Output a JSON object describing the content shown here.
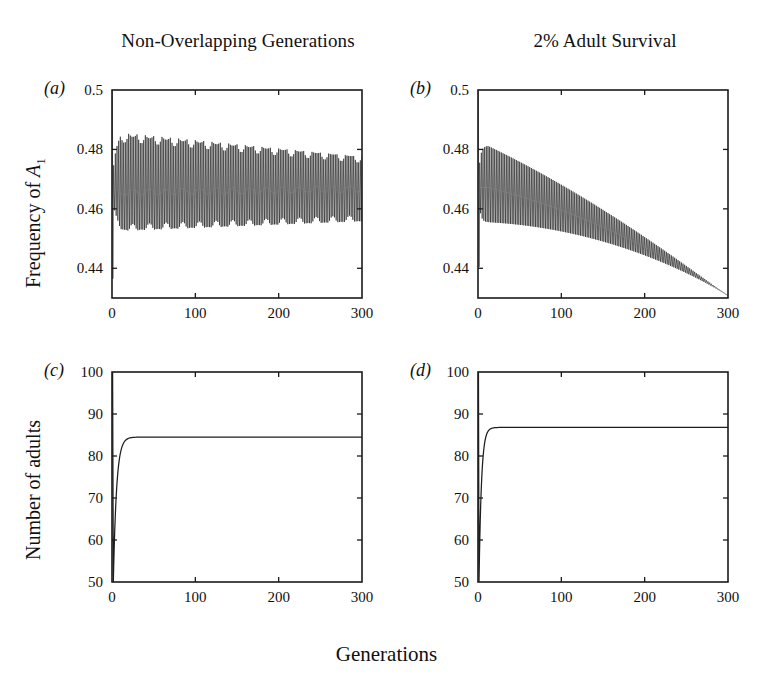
{
  "figure": {
    "column_titles": {
      "left": "Non-Overlapping Generations",
      "right": "2% Adult Survival"
    },
    "x_axis_title": "Generations",
    "y_axis_title_top_prefix": "Frequency of ",
    "y_axis_title_top_symbol": "A",
    "y_axis_title_top_subscript": "1",
    "y_axis_title_bottom": "Number of adults",
    "panel_labels": {
      "a": "(a)",
      "b": "(b)",
      "c": "(c)",
      "d": "(d)"
    },
    "ink_color": "#1d1d1d"
  },
  "chart_data": [
    {
      "id": "panel-a",
      "type": "line",
      "title": "Non-Overlapping Generations",
      "panel_label": "(a)",
      "xlabel": "Generations",
      "ylabel": "Frequency of A1",
      "xlim": [
        0,
        300
      ],
      "ylim": [
        0.43,
        0.5
      ],
      "xticks": [
        0,
        100,
        200,
        300
      ],
      "xtick_labels": [
        "0",
        "100",
        "200",
        "300"
      ],
      "yticks": [
        0.44,
        0.46,
        0.48,
        0.5
      ],
      "ytick_labels": [
        "0.44",
        "0.46",
        "0.48",
        "0.5"
      ],
      "grid": false,
      "legend": "none",
      "description": "Two-cycle allele frequency oscillation with slowly narrowing envelope and a beat modulation near the midline.",
      "series": [
        {
          "name": "Frequency of A1",
          "model": "two_cycle",
          "initial_value": 0.5,
          "transient_min": 0.4365,
          "envelope_upper": {
            "start_gen": 14,
            "start": 0.4855,
            "end_gen": 300,
            "end": 0.4775
          },
          "envelope_lower": {
            "start_gen": 14,
            "start": 0.4525,
            "end_gen": 300,
            "end": 0.4558
          },
          "midline": {
            "start": 0.4655,
            "end": 0.4667
          },
          "beat_period": 20,
          "beat_amplitude": 0.0022,
          "rise_rate": 0.28
        }
      ]
    },
    {
      "id": "panel-b",
      "type": "line",
      "title": "2% Adult Survival",
      "panel_label": "(b)",
      "xlabel": "Generations",
      "ylabel": "Frequency of A1",
      "xlim": [
        0,
        300
      ],
      "ylim": [
        0.43,
        0.5
      ],
      "xticks": [
        0,
        100,
        200,
        300
      ],
      "xtick_labels": [
        "0",
        "100",
        "200",
        "300"
      ],
      "yticks": [
        0.44,
        0.46,
        0.48,
        0.5
      ],
      "ytick_labels": [
        "0.44",
        "0.46",
        "0.48",
        "0.5"
      ],
      "grid": false,
      "legend": "none",
      "description": "Two-cycle oscillation whose amplitude decays to zero while the mean drifts down, converging at the lower axis by generation 300.",
      "series": [
        {
          "name": "Frequency of A1",
          "model": "damped_two_cycle",
          "initial_value": 0.5,
          "transient_min": 0.4405,
          "peak_gen": 12,
          "peak_upper": 0.4812,
          "peak_lower": 0.4555,
          "end_value": 0.4308,
          "midline_peak": 0.4672,
          "decay_exponent": 1.35
        }
      ]
    },
    {
      "id": "panel-c",
      "type": "line",
      "title": "Non-Overlapping Generations",
      "panel_label": "(c)",
      "xlabel": "Generations",
      "ylabel": "Number of adults",
      "xlim": [
        0,
        300
      ],
      "ylim": [
        50,
        100
      ],
      "xticks": [
        0,
        100,
        200,
        300
      ],
      "xtick_labels": [
        "0",
        "100",
        "200",
        "300"
      ],
      "yticks": [
        50,
        60,
        70,
        80,
        90,
        100
      ],
      "ytick_labels": [
        "50",
        "60",
        "70",
        "80",
        "90",
        "100"
      ],
      "grid": false,
      "legend": "none",
      "description": "Adult population crashes from 100 to 50 then rises and saturates at a plateau near 84.5.",
      "series": [
        {
          "name": "Number of adults",
          "model": "crash_and_plateau",
          "initial_value": 100,
          "crash_gen": 1.6,
          "crash_value": 50,
          "plateau_value": 84.5,
          "rise_rate": 0.26,
          "settle_gen": 26
        }
      ]
    },
    {
      "id": "panel-d",
      "type": "line",
      "title": "2% Adult Survival",
      "panel_label": "(d)",
      "xlabel": "Generations",
      "ylabel": "Number of adults",
      "xlim": [
        0,
        300
      ],
      "ylim": [
        50,
        100
      ],
      "xticks": [
        0,
        100,
        200,
        300
      ],
      "xtick_labels": [
        "0",
        "100",
        "200",
        "300"
      ],
      "yticks": [
        50,
        60,
        70,
        80,
        90,
        100
      ],
      "ytick_labels": [
        "50",
        "60",
        "70",
        "80",
        "90",
        "100"
      ],
      "grid": false,
      "legend": "none",
      "description": "Adult population crashes from 100 to 50 then rises quickly and saturates at a plateau near 86.8.",
      "series": [
        {
          "name": "Number of adults",
          "model": "crash_and_plateau",
          "initial_value": 100,
          "crash_gen": 1.2,
          "crash_value": 50,
          "plateau_value": 86.8,
          "rise_rate": 0.34,
          "settle_gen": 22
        }
      ]
    }
  ]
}
